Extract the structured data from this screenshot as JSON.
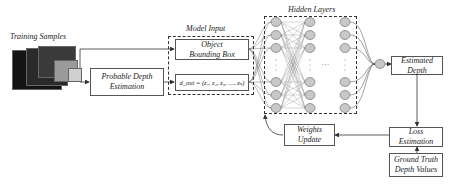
{
  "diagram": {
    "training_samples_label": "Training Samples",
    "probable_depth_label": "Probable Depth Estimation",
    "model_input_label": "Model Input",
    "object_bbox_label": "Object Bounding Box",
    "d_out_formula": "d_out = (z₁, z₂, z₃, …, zₙ)",
    "hidden_layers_label": "Hidden Layers",
    "hidden_ellipsis": "…",
    "estimated_depth_label": "Estimated Depth",
    "loss_estimation_label": "Loss Estimation",
    "ground_truth_label": "Ground Truth Depth Values",
    "weights_update_label": "Weights Update"
  },
  "colors": {
    "node_fill": "#c8c8c8",
    "line": "#333333"
  }
}
